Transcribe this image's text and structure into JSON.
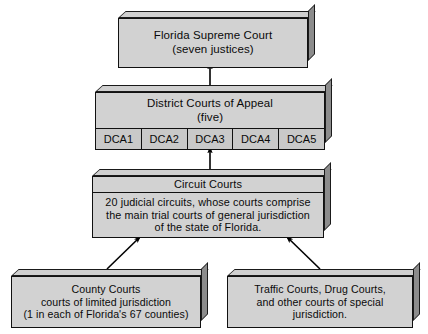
{
  "diagram": {
    "colors": {
      "background": "#ffffff",
      "box_face": "#d2d2d2",
      "box_cell": "#c9c9c9",
      "box_bevel_top": "#cfcfcf",
      "box_side": "#8c8c8c",
      "outline": "#111111",
      "arrow": "#000000"
    },
    "nodes": {
      "supreme": {
        "line1": "Florida Supreme Court",
        "line2": "(seven justices)"
      },
      "dca": {
        "line1": "District Courts of Appeal",
        "line2": "(five)",
        "cells": [
          "DCA1",
          "DCA2",
          "DCA3",
          "DCA4",
          "DCA5"
        ]
      },
      "circuit": {
        "header": "Circuit Courts",
        "line1": "20 judicial circuits,  whose courts comprise",
        "line2": "the main trial courts of general jurisdiction",
        "line3": "of the state of Florida."
      },
      "county": {
        "line1": "County Courts",
        "line2": "courts of limited jurisdiction",
        "line3": "(1 in each of Florida's 67 counties)"
      },
      "special": {
        "line1": "Traffic Courts, Drug Courts,",
        "line2": "and other courts of special",
        "line3": "jurisdiction."
      }
    },
    "connectors": [
      {
        "name": "dca-to-supreme",
        "from": "dca",
        "to": "supreme",
        "style": "vertical-arrow-up"
      },
      {
        "name": "circuit-to-dca",
        "from": "circuit",
        "to": "dca",
        "style": "vertical-arrow-up"
      },
      {
        "name": "county-to-circuit",
        "from": "county",
        "to": "circuit",
        "style": "diagonal-arrow-up-right"
      },
      {
        "name": "special-to-circuit",
        "from": "special",
        "to": "circuit",
        "style": "diagonal-arrow-up-left"
      }
    ]
  }
}
